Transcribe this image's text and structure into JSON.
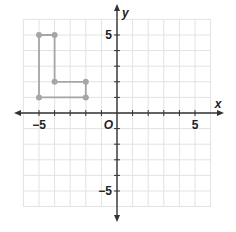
{
  "chart_data": {
    "type": "scatter",
    "title": "",
    "xlabel": "x",
    "ylabel": "y",
    "origin_label": "O",
    "xlim": [
      -6,
      6
    ],
    "ylim": [
      -6,
      6
    ],
    "grid": true,
    "x_tick_labels": [
      {
        "value": -5,
        "label": "−5"
      },
      {
        "value": 5,
        "label": "5"
      }
    ],
    "y_tick_labels": [
      {
        "value": 5,
        "label": "5"
      },
      {
        "value": -5,
        "label": "−5"
      }
    ],
    "polyline": {
      "name": "L-shape",
      "closed": true,
      "color": "#a6a6a6",
      "points": [
        [
          -5,
          5
        ],
        [
          -4,
          5
        ],
        [
          -4,
          2
        ],
        [
          -2,
          2
        ],
        [
          -2,
          1
        ],
        [
          -5,
          1
        ]
      ]
    }
  },
  "colors": {
    "grid": "#e2e2e2",
    "axis": "#333333",
    "shape": "#a6a6a6"
  }
}
